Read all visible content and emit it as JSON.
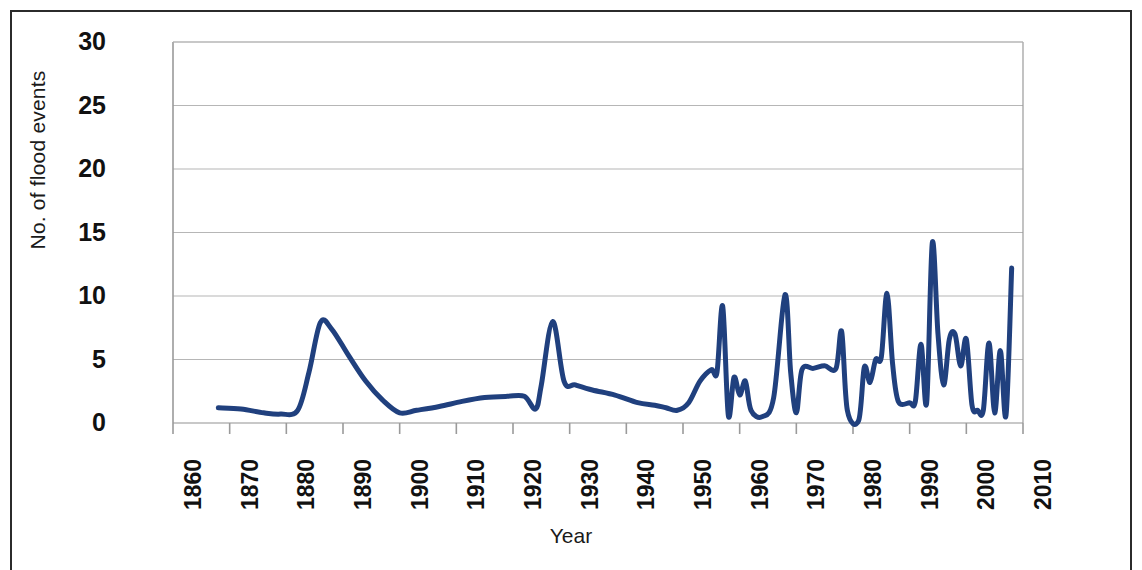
{
  "chart_data": {
    "type": "line",
    "title": "",
    "xlabel": "Year",
    "ylabel": "No. of flood events",
    "xlim": [
      1860,
      2010
    ],
    "ylim": [
      0,
      30
    ],
    "xticks": [
      1860,
      1870,
      1880,
      1890,
      1900,
      1910,
      1920,
      1930,
      1940,
      1950,
      1960,
      1970,
      1980,
      1990,
      2000,
      2010
    ],
    "yticks": [
      0,
      5,
      10,
      15,
      20,
      25,
      30
    ],
    "grid": "horizontal",
    "legend": "none",
    "line_color": "#20407E",
    "line_width": 5,
    "smoothing": "spline",
    "series": [
      {
        "name": "No. of flood events",
        "x": [
          1868,
          1872,
          1876,
          1879,
          1882,
          1884,
          1886,
          1888,
          1891,
          1894,
          1897,
          1900,
          1903,
          1907,
          1911,
          1915,
          1919,
          1922,
          1924,
          1925,
          1927,
          1929,
          1931,
          1934,
          1938,
          1942,
          1945,
          1947,
          1949,
          1951,
          1953,
          1955,
          1956,
          1957,
          1958,
          1959,
          1960,
          1961,
          1962,
          1964,
          1966,
          1968,
          1969,
          1970,
          1971,
          1973,
          1975,
          1977,
          1978,
          1979,
          1981,
          1982,
          1983,
          1984,
          1985,
          1986,
          1987,
          1988,
          1990,
          1991,
          1992,
          1993,
          1994,
          1995,
          1996,
          1997,
          1998,
          1999,
          2000,
          2001,
          2002,
          2003,
          2004,
          2005,
          2006,
          2007,
          2008
        ],
        "values": [
          1.2,
          1.1,
          0.8,
          0.7,
          1.0,
          4.0,
          7.9,
          7.4,
          5.3,
          3.3,
          1.8,
          0.8,
          1.0,
          1.3,
          1.7,
          2.0,
          2.1,
          2.1,
          1.1,
          3.0,
          8.0,
          3.3,
          3.0,
          2.6,
          2.2,
          1.6,
          1.4,
          1.2,
          1.0,
          1.6,
          3.3,
          4.2,
          4.0,
          9.2,
          0.6,
          3.6,
          2.2,
          3.3,
          1.0,
          0.5,
          2.0,
          10.1,
          4.0,
          0.8,
          4.2,
          4.3,
          4.5,
          4.3,
          7.2,
          1.0,
          0.2,
          4.4,
          3.2,
          5.0,
          5.2,
          10.2,
          4.6,
          1.7,
          1.6,
          1.7,
          6.2,
          1.6,
          14.2,
          7.0,
          3.0,
          6.6,
          7.0,
          4.5,
          6.6,
          1.4,
          1.0,
          1.0,
          6.3,
          0.8,
          5.7,
          0.6,
          12.2
        ]
      }
    ]
  },
  "axes": {
    "y_tick_labels": [
      "30",
      "25",
      "20",
      "15",
      "10",
      "5",
      "0"
    ],
    "x_tick_labels": [
      "1860",
      "1870",
      "1880",
      "1890",
      "1900",
      "1910",
      "1920",
      "1930",
      "1940",
      "1950",
      "1960",
      "1970",
      "1980",
      "1990",
      "2000",
      "2010"
    ],
    "y_title": "No. of flood events",
    "x_title": "Year"
  },
  "style": {
    "plot_bg": "#ffffff",
    "gridline_color": "#b6b6b6",
    "axis_color": "#9a9a9a",
    "frame_color": "#2b2b2b",
    "text_color": "#111111"
  }
}
